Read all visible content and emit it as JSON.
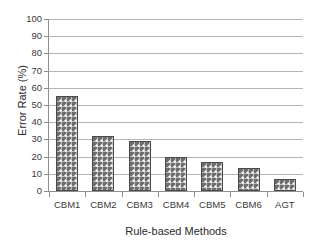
{
  "figure": {
    "background_color": "#ffffff",
    "top_crop_remnant": "· ·  ·   ·"
  },
  "chart_data": {
    "type": "bar",
    "title": "",
    "subtitle": "",
    "xlabel": "Rule-based Methods",
    "ylabel": "Error Rate (%)",
    "categories": [
      "CBM1",
      "CBM2",
      "CBM3",
      "CBM4",
      "CBM5",
      "CBM6",
      "AGT"
    ],
    "values": [
      55,
      32,
      29,
      20,
      17,
      13.5,
      7
    ],
    "series": [
      {
        "name": "Error Rate",
        "values": [
          55,
          32,
          29,
          20,
          17,
          13.5,
          7
        ]
      }
    ],
    "ylim": [
      0,
      100
    ],
    "y_ticks": [
      0,
      10,
      20,
      30,
      40,
      50,
      60,
      70,
      80,
      90,
      100
    ],
    "y_tick_labels": [
      "0",
      "10",
      "20",
      "30",
      "40",
      "50",
      "60",
      "70",
      "80",
      "90",
      "100"
    ],
    "grid": "horizontal",
    "legend": "none",
    "annotations": [],
    "style": {
      "bar_fill_color": "#6e6e6e",
      "bar_pattern": "white-checkered-dots",
      "bar_edge_color": "#4a4a4a",
      "gridline_color": "#b4b4b4",
      "axis_color": "#8f8f8f",
      "text_color": "#2b2b2b"
    }
  }
}
